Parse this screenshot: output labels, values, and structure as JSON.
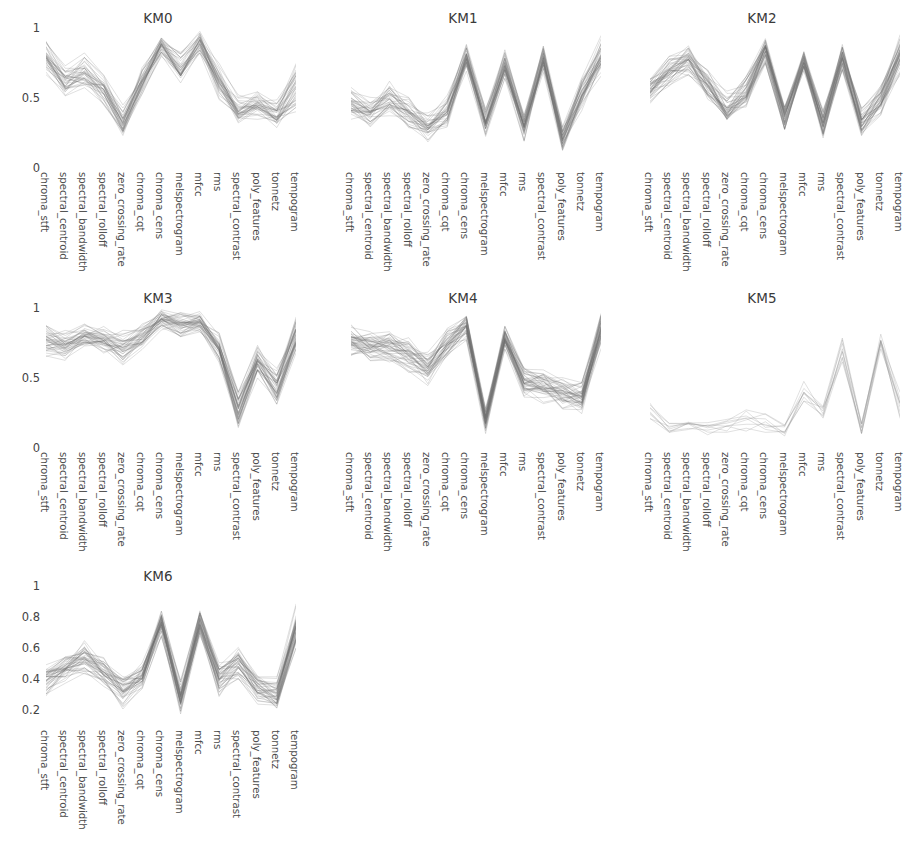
{
  "figure": {
    "width": 923,
    "height": 852,
    "background": "#ffffff",
    "line_color": "#6f6f6f",
    "grid": false,
    "layout": "3 columns x 3 rows, 7 panels used"
  },
  "features": [
    "chroma_stft",
    "spectral_centroid",
    "spectral_bandwidth",
    "spectral_rolloff",
    "zero_crossing_rate",
    "chroma_cqt",
    "chroma_cens",
    "melspectrogram",
    "mfcc",
    "rms",
    "spectral_contrast",
    "poly_features",
    "tonnetz",
    "tempogram"
  ],
  "panels": [
    {
      "title": "KM0",
      "yticks": [
        "1",
        "0.5",
        "0"
      ],
      "ytickvals": [
        1,
        0.5,
        0
      ]
    },
    {
      "title": "KM1",
      "yticks": [],
      "ytickvals": []
    },
    {
      "title": "KM2",
      "yticks": [],
      "ytickvals": []
    },
    {
      "title": "KM3",
      "yticks": [
        "1",
        "0.5",
        "0"
      ],
      "ytickvals": [
        1,
        0.5,
        0
      ]
    },
    {
      "title": "KM4",
      "yticks": [],
      "ytickvals": []
    },
    {
      "title": "KM5",
      "yticks": [],
      "ytickvals": []
    },
    {
      "title": "KM6",
      "yticks": [
        "1",
        "0.8",
        "0.6",
        "0.4",
        "0.2"
      ],
      "ytickvals": [
        1,
        0.8,
        0.6,
        0.4,
        0.2
      ]
    }
  ],
  "chart_data": {
    "type": "line",
    "title": "",
    "subtitle": "",
    "xlabel": "",
    "ylabel": "",
    "ylim": [
      0,
      1
    ],
    "grid": false,
    "legend": "none",
    "categories": [
      "chroma_stft",
      "spectral_centroid",
      "spectral_bandwidth",
      "spectral_rolloff",
      "zero_crossing_rate",
      "chroma_cqt",
      "chroma_cens",
      "melspectrogram",
      "mfcc",
      "rms",
      "spectral_contrast",
      "poly_features",
      "tonnetz",
      "tempogram"
    ],
    "subplots": [
      {
        "title": "KM0",
        "ylim": [
          0,
          1
        ],
        "yticks": [
          0,
          0.5,
          1
        ],
        "n_lines": 38,
        "mean": [
          0.8,
          0.62,
          0.7,
          0.58,
          0.33,
          0.62,
          0.88,
          0.72,
          0.9,
          0.62,
          0.4,
          0.46,
          0.38,
          0.58
        ],
        "spread": [
          0.14,
          0.12,
          0.14,
          0.14,
          0.14,
          0.13,
          0.1,
          0.16,
          0.09,
          0.16,
          0.14,
          0.12,
          0.13,
          0.2
        ]
      },
      {
        "title": "KM1",
        "ylim": [
          0,
          1
        ],
        "yticks": [],
        "n_lines": 40,
        "mean": [
          0.46,
          0.4,
          0.5,
          0.4,
          0.28,
          0.4,
          0.8,
          0.33,
          0.74,
          0.3,
          0.78,
          0.22,
          0.52,
          0.8
        ],
        "spread": [
          0.14,
          0.12,
          0.14,
          0.13,
          0.13,
          0.14,
          0.12,
          0.12,
          0.11,
          0.12,
          0.12,
          0.11,
          0.14,
          0.16
        ]
      },
      {
        "title": "KM2",
        "ylim": [
          0,
          1
        ],
        "yticks": [],
        "n_lines": 44,
        "mean": [
          0.58,
          0.7,
          0.78,
          0.6,
          0.42,
          0.55,
          0.84,
          0.38,
          0.78,
          0.32,
          0.8,
          0.34,
          0.5,
          0.82
        ],
        "spread": [
          0.14,
          0.12,
          0.13,
          0.13,
          0.14,
          0.13,
          0.1,
          0.12,
          0.1,
          0.12,
          0.11,
          0.12,
          0.13,
          0.17
        ]
      },
      {
        "title": "KM3",
        "ylim": [
          0,
          1
        ],
        "yticks": [
          0,
          0.5,
          1
        ],
        "n_lines": 42,
        "mean": [
          0.78,
          0.74,
          0.8,
          0.76,
          0.72,
          0.8,
          0.92,
          0.88,
          0.9,
          0.72,
          0.28,
          0.62,
          0.44,
          0.8
        ],
        "spread": [
          0.14,
          0.12,
          0.12,
          0.13,
          0.13,
          0.11,
          0.08,
          0.11,
          0.08,
          0.13,
          0.14,
          0.13,
          0.14,
          0.14
        ]
      },
      {
        "title": "KM4",
        "ylim": [
          0,
          1
        ],
        "yticks": [],
        "n_lines": 46,
        "mean": [
          0.76,
          0.72,
          0.72,
          0.66,
          0.56,
          0.74,
          0.86,
          0.2,
          0.78,
          0.46,
          0.44,
          0.38,
          0.36,
          0.84
        ],
        "spread": [
          0.13,
          0.12,
          0.12,
          0.13,
          0.14,
          0.12,
          0.1,
          0.1,
          0.1,
          0.13,
          0.14,
          0.13,
          0.14,
          0.14
        ]
      },
      {
        "title": "KM5",
        "ylim": [
          0,
          1
        ],
        "yticks": [],
        "n_lines": 9,
        "mean": [
          0.26,
          0.15,
          0.16,
          0.14,
          0.16,
          0.22,
          0.2,
          0.14,
          0.4,
          0.26,
          0.7,
          0.16,
          0.78,
          0.3
        ],
        "spread": [
          0.1,
          0.07,
          0.07,
          0.07,
          0.08,
          0.12,
          0.12,
          0.08,
          0.12,
          0.09,
          0.13,
          0.09,
          0.14,
          0.16
        ]
      },
      {
        "title": "KM6",
        "ylim": [
          0.1,
          1
        ],
        "yticks": [
          0.2,
          0.4,
          0.6,
          0.8,
          1
        ],
        "n_lines": 44,
        "mean": [
          0.4,
          0.46,
          0.54,
          0.44,
          0.32,
          0.42,
          0.76,
          0.28,
          0.76,
          0.4,
          0.5,
          0.34,
          0.3,
          0.72
        ],
        "spread": [
          0.12,
          0.11,
          0.12,
          0.11,
          0.12,
          0.11,
          0.1,
          0.12,
          0.1,
          0.12,
          0.12,
          0.11,
          0.12,
          0.17
        ]
      }
    ]
  }
}
